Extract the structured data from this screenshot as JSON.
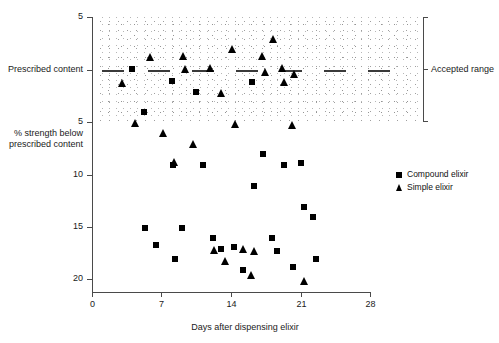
{
  "chart_data": {
    "type": "scatter",
    "title": "",
    "xlabel": "Days after dispensing elixir",
    "ylabel": "% strength below prescribed content",
    "prescribed_label": "Prescribed content",
    "accepted_range_label": "Accepted range",
    "xlim": [
      0,
      28
    ],
    "ylim_top_label": "5",
    "x_ticks": [
      0,
      7,
      14,
      21,
      28
    ],
    "x_tick_labels": [
      "0",
      "7",
      "14",
      "21",
      "28"
    ],
    "y_ticks": [
      -5,
      0,
      5,
      10,
      15,
      20
    ],
    "y_tick_labels": [
      "5",
      "Prescribed content",
      "5",
      "10",
      "15",
      "20"
    ],
    "grid": false,
    "legend_position": "right-middle",
    "series": [
      {
        "name": "Compound elixir",
        "marker": "square",
        "points": [
          [
            4.0,
            -0.1
          ],
          [
            5.2,
            4.0
          ],
          [
            5.3,
            15.0
          ],
          [
            6.4,
            16.7
          ],
          [
            8.1,
            1.0
          ],
          [
            8.2,
            9.0
          ],
          [
            8.4,
            18.0
          ],
          [
            9.1,
            15.0
          ],
          [
            10.5,
            2.1
          ],
          [
            11.2,
            9.0
          ],
          [
            12.2,
            16.0
          ],
          [
            13.0,
            17.0
          ],
          [
            14.3,
            16.9
          ],
          [
            15.2,
            19.0
          ],
          [
            16.1,
            1.1
          ],
          [
            16.3,
            11.0
          ],
          [
            17.2,
            8.0
          ],
          [
            18.1,
            16.0
          ],
          [
            18.6,
            17.2
          ],
          [
            19.3,
            9.0
          ],
          [
            20.2,
            18.8
          ],
          [
            21.1,
            8.9
          ],
          [
            21.4,
            13.0
          ],
          [
            22.3,
            14.0
          ],
          [
            22.6,
            18.0
          ]
        ]
      },
      {
        "name": "Simple elixir",
        "marker": "triangle",
        "points": [
          [
            3.1,
            1.2
          ],
          [
            4.4,
            5.0
          ],
          [
            5.9,
            -1.2
          ],
          [
            7.2,
            6.0
          ],
          [
            8.3,
            8.8
          ],
          [
            9.2,
            -1.3
          ],
          [
            9.4,
            -0.1
          ],
          [
            10.2,
            7.0
          ],
          [
            11.9,
            -0.2
          ],
          [
            12.3,
            17.1
          ],
          [
            13.0,
            2.2
          ],
          [
            13.4,
            18.2
          ],
          [
            14.2,
            -2.0
          ],
          [
            14.5,
            5.1
          ],
          [
            15.3,
            17.0
          ],
          [
            16.1,
            19.5
          ],
          [
            16.4,
            17.2
          ],
          [
            17.2,
            -1.3
          ],
          [
            17.5,
            0.2
          ],
          [
            18.3,
            -3.0
          ],
          [
            19.2,
            -0.2
          ],
          [
            19.4,
            1.1
          ],
          [
            20.2,
            5.2
          ],
          [
            20.4,
            0.4
          ],
          [
            21.4,
            20.1
          ]
        ]
      }
    ]
  }
}
